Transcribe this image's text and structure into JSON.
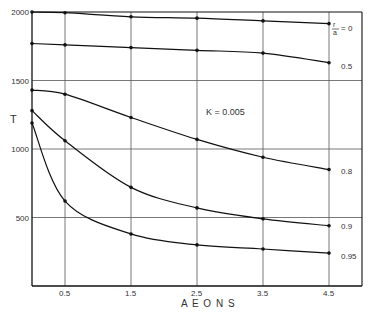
{
  "chart_data": {
    "type": "line",
    "title": "",
    "xlabel": "AEONS",
    "ylabel": "T",
    "xlim": [
      0,
      5.0
    ],
    "ylim": [
      0,
      2000
    ],
    "xticks": [
      0.5,
      1.5,
      2.5,
      3.5,
      4.5
    ],
    "xtick_labels": [
      "0.5",
      "1.5",
      "2.5",
      "3.5",
      "4.5"
    ],
    "yticks": [
      500,
      1000,
      1500,
      2000
    ],
    "ytick_labels": [
      "500",
      "1000",
      "1500",
      "2000"
    ],
    "grid": true,
    "annotation": "K = 0.005",
    "legend_position": "right, inline labels at curve ends",
    "x": [
      0,
      0.5,
      1.5,
      2.5,
      3.5,
      4.5
    ],
    "series": [
      {
        "name": "r/a = 0",
        "label": "r/a = 0",
        "values": [
          2000,
          1995,
          1965,
          1955,
          1935,
          1915
        ]
      },
      {
        "name": "0.5",
        "label": "0.5",
        "values": [
          1770,
          1760,
          1740,
          1720,
          1700,
          1630
        ]
      },
      {
        "name": "0.8",
        "label": "0.8",
        "values": [
          1430,
          1400,
          1230,
          1070,
          940,
          850
        ]
      },
      {
        "name": "0.9",
        "label": "0.9",
        "values": [
          1280,
          1060,
          720,
          570,
          490,
          440
        ]
      },
      {
        "name": "0.95",
        "label": "0.95",
        "values": [
          1190,
          620,
          380,
          300,
          270,
          240
        ]
      }
    ]
  },
  "labels": {
    "ylabel": "T",
    "xlabel": "A E O N S",
    "annotation": "K = 0.005",
    "r0_prefix_num": "r",
    "r0_prefix_den": "a",
    "r0_suffix": "= 0",
    "series_labels": [
      "0.5",
      "0.8",
      "0.9",
      "0.95"
    ],
    "xtick_labels": [
      "0.5",
      "1.5",
      "2.5",
      "3.5",
      "4.5"
    ],
    "ytick_labels": [
      "500",
      "1000",
      "1500",
      "2000"
    ]
  }
}
